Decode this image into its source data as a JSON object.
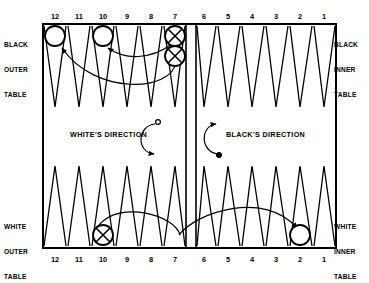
{
  "diagram": {
    "quadrant_labels": {
      "black_outer": [
        "BLACK",
        "OUTER",
        "TABLE"
      ],
      "black_inner": [
        "BLACK",
        "INNER",
        "TABLE"
      ],
      "white_outer": [
        "WHITE",
        "OUTER",
        "TABLE"
      ],
      "white_inner": [
        "WHITE",
        "INNER",
        "TABLE"
      ]
    },
    "direction_labels": {
      "white": "WHITE'S DIRECTION",
      "black": "BLACK'S DIRECTION"
    },
    "point_numbers_top": [
      "12",
      "11",
      "10",
      "9",
      "8",
      "7",
      "6",
      "5",
      "4",
      "3",
      "2",
      "1"
    ],
    "point_numbers_bottom": [
      "12",
      "11",
      "10",
      "9",
      "8",
      "7",
      "6",
      "5",
      "4",
      "3",
      "2",
      "1"
    ],
    "colors": {
      "ink": "#000000",
      "paper": "#ffffff",
      "white_checker_fill": "#ffffff",
      "black_checker_fill": "#ffffff"
    },
    "checkers": [
      {
        "id": "top-12-white",
        "point": "12",
        "row": "top",
        "color": "white",
        "marker": "plain"
      },
      {
        "id": "top-10-white",
        "point": "10",
        "row": "top",
        "color": "white",
        "marker": "plain"
      },
      {
        "id": "top-7-black-a",
        "point": "7",
        "row": "top",
        "color": "black",
        "marker": "cross"
      },
      {
        "id": "top-7-black-b",
        "point": "7",
        "row": "top",
        "color": "black",
        "marker": "cross"
      },
      {
        "id": "bot-10-black",
        "point": "10",
        "row": "bottom",
        "color": "black",
        "marker": "cross"
      },
      {
        "id": "bot-2-white",
        "point": "2",
        "row": "bottom",
        "color": "white",
        "marker": "plain"
      }
    ],
    "move_arrows": [
      {
        "id": "white-move-7-to-10",
        "from": "top point 7",
        "to": "top point 10"
      },
      {
        "id": "white-move-7-to-12",
        "from": "top point 7",
        "to": "top point 12"
      },
      {
        "id": "black-move-10-to-2",
        "from": "bottom point 10",
        "to": "bottom point 2"
      }
    ],
    "direction_arrows": [
      {
        "id": "white-direction-arrow",
        "sense": "counterclockwise",
        "endpoint_marker": "open-dot"
      },
      {
        "id": "black-direction-arrow",
        "sense": "counterclockwise",
        "endpoint_marker": "filled-dot"
      }
    ]
  }
}
